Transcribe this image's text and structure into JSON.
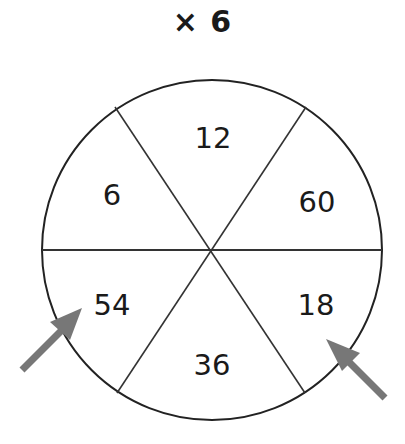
{
  "title": "× 6",
  "wheel": {
    "center_value_operation": "× 6",
    "sectors": [
      {
        "position": "top",
        "value": "12"
      },
      {
        "position": "upper-right",
        "value": "60"
      },
      {
        "position": "lower-right",
        "value": "18"
      },
      {
        "position": "bottom",
        "value": "36"
      },
      {
        "position": "lower-left",
        "value": "54"
      },
      {
        "position": "upper-left",
        "value": "6"
      }
    ]
  },
  "arrows": [
    {
      "points_to": "54",
      "color": "#777777"
    },
    {
      "points_to": "18",
      "color": "#777777"
    }
  ],
  "colors": {
    "line": "#222222",
    "arrow": "#777777",
    "text": "#1a1a1a"
  }
}
